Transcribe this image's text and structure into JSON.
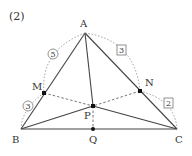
{
  "problem_label": "(2)",
  "points": {
    "A": {
      "label": "A",
      "x": 85,
      "y": 33
    },
    "B": {
      "label": "B",
      "x": 21,
      "y": 129
    },
    "C": {
      "label": "C",
      "x": 177,
      "y": 129
    },
    "M": {
      "label": "M",
      "x": 44,
      "y": 93
    },
    "N": {
      "label": "N",
      "x": 140,
      "y": 91
    },
    "P": {
      "label": "P",
      "x": 93,
      "y": 106
    },
    "Q": {
      "label": "Q",
      "x": 93,
      "y": 129
    }
  },
  "ratio_marks": {
    "AM": {
      "value": "5",
      "shape": "circle"
    },
    "MB": {
      "value": "3",
      "shape": "circle"
    },
    "AN": {
      "value": "3",
      "shape": "square"
    },
    "NC": {
      "value": "2",
      "shape": "square"
    }
  },
  "colors": {
    "line": "#444444",
    "dashed": "#666666",
    "point": "#111111"
  }
}
